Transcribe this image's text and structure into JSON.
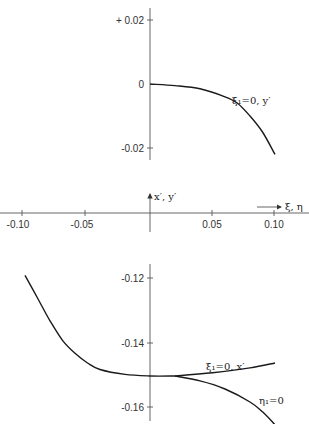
{
  "chart_data": [
    {
      "type": "line",
      "title": "",
      "panel": "upper",
      "xlabel": "ξ, η",
      "ylabel": "y′",
      "xlim": [
        -0.1,
        0.1
      ],
      "ylim": [
        -0.025,
        0.025
      ],
      "yticks": [
        0.02,
        0,
        -0.02
      ],
      "ytick_labels": [
        "+ 0.02",
        "0",
        "-0.02"
      ],
      "grid": false,
      "series": [
        {
          "name": "ξ₁=0, y′",
          "x": [
            0,
            0.02,
            0.04,
            0.06,
            0.07,
            0.08,
            0.09,
            0.1
          ],
          "y": [
            0,
            -0.0005,
            -0.0015,
            -0.004,
            -0.006,
            -0.01,
            -0.015,
            -0.022
          ]
        }
      ]
    },
    {
      "type": "line",
      "panel": "middle-axis",
      "xlabel": "ξ, η",
      "ylabel": "x′, y′",
      "xticks": [
        -0.1,
        -0.05,
        0.05,
        0.1
      ],
      "xtick_labels": [
        "-0.10",
        "-0.05",
        "0.05",
        "0.10"
      ]
    },
    {
      "type": "line",
      "title": "",
      "panel": "lower",
      "xlabel": "ξ, η",
      "ylabel": "x′",
      "xlim": [
        -0.1,
        0.1
      ],
      "ylim": [
        -0.165,
        -0.115
      ],
      "yticks": [
        -0.12,
        -0.14,
        -0.16
      ],
      "ytick_labels": [
        "-0.12",
        "-0.14",
        "-0.16"
      ],
      "grid": false,
      "series": [
        {
          "name": "common branch",
          "x": [
            -0.1,
            -0.09,
            -0.08,
            -0.07,
            -0.06,
            -0.05,
            -0.04,
            -0.02,
            0,
            0.02
          ],
          "y": [
            -0.119,
            -0.126,
            -0.133,
            -0.139,
            -0.143,
            -0.146,
            -0.148,
            -0.1495,
            -0.15,
            -0.15
          ]
        },
        {
          "name": "ξ₁=0, x′",
          "x": [
            0.02,
            0.05,
            0.08,
            0.1
          ],
          "y": [
            -0.15,
            -0.149,
            -0.1475,
            -0.146
          ]
        },
        {
          "name": "η₁=0",
          "x": [
            0.02,
            0.04,
            0.06,
            0.08,
            0.09,
            0.1
          ],
          "y": [
            -0.15,
            -0.1515,
            -0.154,
            -0.158,
            -0.161,
            -0.165
          ]
        }
      ]
    }
  ],
  "labels": {
    "upper_ticks": [
      "+ 0.02",
      "0",
      "-0.02"
    ],
    "lower_ticks": [
      "-0.12",
      "-0.14",
      "-0.16"
    ],
    "x_ticks": [
      "-0.10",
      "-0.05",
      "0.05",
      "0.10"
    ],
    "middle_axis_label": "x′, y′",
    "x_axis_label": "ξ, η",
    "upper_curve_label": "ξ₁=0, y′",
    "lower_upper_branch_label": "ξ₁=0, x′",
    "lower_lower_branch_label": "η₁=0"
  }
}
